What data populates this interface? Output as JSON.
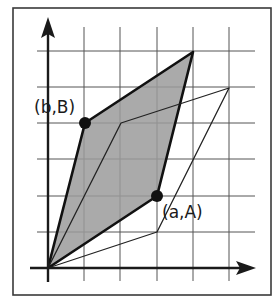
{
  "diagram": {
    "title": "",
    "colors": {
      "fill": "#9b9b9b",
      "ink": "#111111",
      "grid": "#555555",
      "frame": "#3a3a3a"
    },
    "grid": {
      "origin_px": [
        48,
        268
      ],
      "cell_px": 36.2,
      "x_lines": [
        0,
        1,
        2,
        3,
        4,
        5
      ],
      "y_lines": [
        0,
        1,
        2,
        3,
        4,
        5,
        6
      ]
    },
    "points": {
      "origin": {
        "grid": [
          0,
          0
        ],
        "label": ""
      },
      "a": {
        "grid": [
          3,
          2
        ],
        "label": "(a,A)"
      },
      "b": {
        "grid": [
          1,
          4
        ],
        "label": "(b,B)"
      },
      "sum": {
        "grid": [
          4,
          6
        ],
        "label": ""
      },
      "inner_upper": {
        "grid": [
          2,
          4
        ],
        "label": ""
      },
      "inner_lower": {
        "grid": [
          3,
          1
        ],
        "label": ""
      },
      "inner_sum": {
        "grid": [
          5,
          5
        ],
        "label": ""
      }
    },
    "shaded_parallelogram": [
      "origin",
      "a",
      "sum",
      "b"
    ],
    "thin_parallelogram": [
      "origin",
      "inner_lower",
      "inner_sum",
      "inner_upper"
    ],
    "labels": {
      "a": "(a,A)",
      "b": "(b,B)"
    },
    "axes": {
      "x_arrow": true,
      "y_arrow": true
    }
  }
}
